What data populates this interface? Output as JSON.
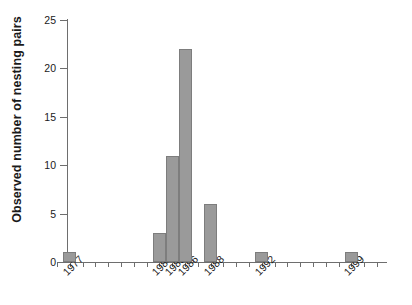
{
  "chart_data": {
    "type": "bar",
    "title": "",
    "xlabel": "",
    "ylabel": "Observed number of nesting pairs",
    "categories": [
      "1977",
      "1984",
      "1985",
      "1986",
      "1988",
      "1992",
      "1999"
    ],
    "values": [
      1,
      3,
      11,
      22,
      6,
      1,
      1
    ],
    "ylim": [
      0,
      25
    ],
    "ytick_labels": [
      "0",
      "5",
      "10",
      "15",
      "20",
      "25"
    ],
    "ytick_values": [
      0,
      5,
      10,
      15,
      20,
      25
    ],
    "xtick_labels": [
      "1977",
      "1984",
      "1985",
      "1986",
      "1988",
      "1992",
      "1999"
    ],
    "x_axis_range": [
      "1976",
      "2001"
    ],
    "x_minor_tick_years": [
      1976,
      1977,
      1978,
      1979,
      1980,
      1981,
      1982,
      1983,
      1984,
      1985,
      1986,
      1987,
      1988,
      1989,
      1990,
      1991,
      1992,
      1993,
      1994,
      1995,
      1996,
      1997,
      1998,
      1999,
      2000,
      2001
    ],
    "grid": false,
    "legend": "none",
    "bar_color": "#9a9a9a",
    "bar_edge_color": "#7d7d7d",
    "axis_color": "#6e6e6e",
    "background_color": "#ffffff",
    "series": [
      {
        "name": "Observed nesting pairs",
        "points": [
          {
            "year": "1977",
            "value": 1
          },
          {
            "year": "1984",
            "value": 3
          },
          {
            "year": "1985",
            "value": 11
          },
          {
            "year": "1986",
            "value": 22
          },
          {
            "year": "1988",
            "value": 6
          },
          {
            "year": "1992",
            "value": 1
          },
          {
            "year": "1999",
            "value": 1
          }
        ]
      }
    ]
  }
}
